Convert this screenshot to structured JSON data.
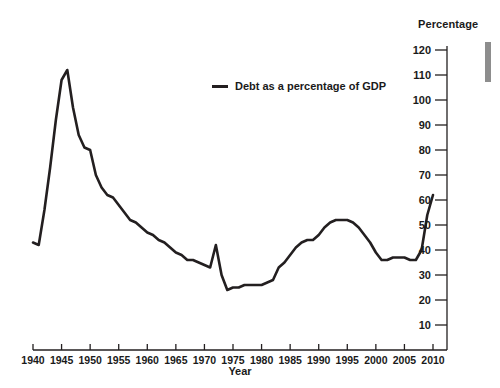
{
  "chart_data": {
    "type": "line",
    "title": "",
    "xlabel": "Year",
    "ylabel": "Percentage",
    "legend": [
      {
        "name": "Debt as a percentage of GDP",
        "color": "#231f20"
      }
    ],
    "legend_position": "inside-top-center",
    "grid": false,
    "xlim": [
      1940,
      2010
    ],
    "ylim": [
      0,
      120
    ],
    "ytick_labels": [
      "120",
      "110",
      "100",
      "90",
      "80",
      "70",
      "60",
      "50",
      "40",
      "30",
      "20",
      "10"
    ],
    "yticks": [
      120,
      110,
      100,
      90,
      80,
      70,
      60,
      50,
      40,
      30,
      20,
      10
    ],
    "xtick_labels": [
      "1940",
      "1945",
      "1950",
      "1955",
      "1960",
      "1965",
      "1970",
      "1975",
      "1980",
      "1985",
      "1990",
      "1995",
      "2000",
      "2005",
      "2010"
    ],
    "xticks": [
      1940,
      1945,
      1950,
      1955,
      1960,
      1965,
      1970,
      1975,
      1980,
      1985,
      1990,
      1995,
      2000,
      2005,
      2010
    ],
    "series": [
      {
        "name": "Debt as a percentage of GDP",
        "x": [
          1940,
          1941,
          1942,
          1943,
          1944,
          1945,
          1946,
          1947,
          1948,
          1949,
          1950,
          1951,
          1952,
          1953,
          1954,
          1955,
          1956,
          1957,
          1958,
          1959,
          1960,
          1961,
          1962,
          1963,
          1964,
          1965,
          1966,
          1967,
          1968,
          1969,
          1970,
          1971,
          1972,
          1973,
          1974,
          1975,
          1976,
          1977,
          1978,
          1979,
          1980,
          1981,
          1982,
          1983,
          1984,
          1985,
          1986,
          1987,
          1988,
          1989,
          1990,
          1991,
          1992,
          1993,
          1994,
          1995,
          1996,
          1997,
          1998,
          1999,
          2000,
          2001,
          2002,
          2003,
          2004,
          2005,
          2006,
          2007,
          2008,
          2009,
          2010
        ],
        "y": [
          43,
          42,
          56,
          73,
          92,
          108,
          112,
          97,
          86,
          81,
          80,
          70,
          65,
          62,
          61,
          58,
          55,
          52,
          51,
          49,
          47,
          46,
          44,
          43,
          41,
          39,
          38,
          36,
          36,
          35,
          34,
          33,
          42,
          30,
          24,
          25,
          25,
          26,
          26,
          26,
          26,
          27,
          28,
          33,
          35,
          38,
          41,
          43,
          44,
          44,
          46,
          49,
          51,
          52,
          52,
          52,
          51,
          49,
          46,
          43,
          39,
          36,
          36,
          37,
          37,
          37,
          36,
          36,
          40,
          54,
          62
        ]
      }
    ]
  },
  "axis": {
    "y_title": "Percentage",
    "x_title": "Year"
  },
  "legend": {
    "label": "Debt as a percentage of GDP"
  },
  "marker": {
    "name": "right-edge-bar"
  }
}
